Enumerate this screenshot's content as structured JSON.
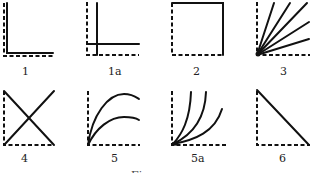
{
  "figure": {
    "caption": "Figure",
    "panels": [
      {
        "id": "1",
        "label": "1",
        "shape": "L-shape hugging axes"
      },
      {
        "id": "1a",
        "label": "1a",
        "shape": "offset L crossing near origin"
      },
      {
        "id": "2",
        "label": "2",
        "shape": "square (top and right solid)"
      },
      {
        "id": "3",
        "label": "3",
        "shape": "fan of five straight rays from origin"
      },
      {
        "id": "4",
        "label": "4",
        "shape": "X crossing lines"
      },
      {
        "id": "5",
        "label": "5",
        "shape": "two concave-down saturating curves"
      },
      {
        "id": "5a",
        "label": "5a",
        "shape": "three convex rising curves from origin"
      },
      {
        "id": "6",
        "label": "6",
        "shape": "descending diagonal line"
      }
    ]
  },
  "colors": {
    "ink": "#111111",
    "background": "#ffffff"
  }
}
